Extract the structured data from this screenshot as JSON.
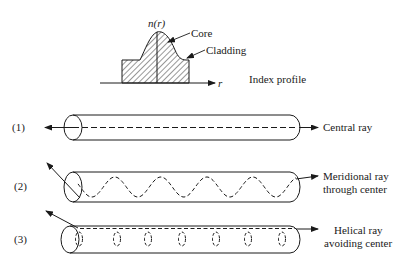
{
  "profile": {
    "axis_label": "n(r)",
    "r_label": "r",
    "core_label": "Core",
    "cladding_label": "Cladding",
    "caption": "Index profile"
  },
  "rays": [
    {
      "number": "(1)",
      "label_lines": [
        "Central ray"
      ],
      "type": "central"
    },
    {
      "number": "(2)",
      "label_lines": [
        "Meridional ray",
        "through center"
      ],
      "type": "meridional"
    },
    {
      "number": "(3)",
      "label_lines": [
        "Helical ray",
        "avoiding center"
      ],
      "type": "helical"
    }
  ],
  "colors": {
    "ink": "#1a1a1a",
    "background": "#ffffff"
  }
}
